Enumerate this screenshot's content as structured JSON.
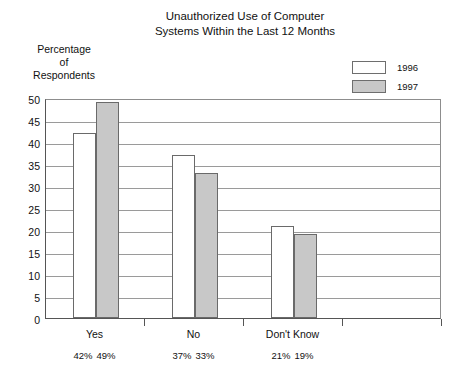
{
  "chart_data": {
    "type": "bar",
    "title": "Unauthorized Use of Computer Systems Within the Last 12 Months",
    "title_lines": [
      "Unauthorized Use of Computer",
      "Systems Within the Last 12 Months"
    ],
    "ylabel_lines": [
      "Percentage",
      "of",
      "Respondents"
    ],
    "ylabel": "Percentage of Respondents",
    "xlabel": "",
    "categories": [
      "Yes",
      "No",
      "Don't Know"
    ],
    "ylim": [
      0,
      50
    ],
    "ytick_step": 5,
    "yticks": [
      50,
      45,
      40,
      35,
      30,
      25,
      20,
      15,
      10,
      5,
      0
    ],
    "ytick_labels": [
      "50",
      "45",
      "40",
      "35",
      "30",
      "25",
      "20",
      "15",
      "10",
      "5",
      "0"
    ],
    "grid": true,
    "legend_position": "top-right",
    "series": [
      {
        "name": "1996",
        "color": "#ffffff",
        "values": [
          42,
          37,
          21
        ],
        "value_labels": [
          "42%",
          "37%",
          "21%"
        ]
      },
      {
        "name": "1997",
        "color": "#c8c8c8",
        "values": [
          49,
          33,
          19
        ],
        "value_labels": [
          "49%",
          "33%",
          "19%"
        ]
      }
    ],
    "empty_category_slots": 1
  },
  "legend": {
    "items": [
      {
        "label": "1996",
        "swatch": "white-swatch-icon"
      },
      {
        "label": "1997",
        "swatch": "gray-swatch-icon"
      }
    ]
  },
  "colors": {
    "bar_1996": "#ffffff",
    "bar_1997": "#c8c8c8",
    "bar_outline": "#6a6a6a",
    "gridline": "#9a9a9a",
    "axis": "#555555",
    "text": "#111111",
    "background": "#ffffff"
  }
}
